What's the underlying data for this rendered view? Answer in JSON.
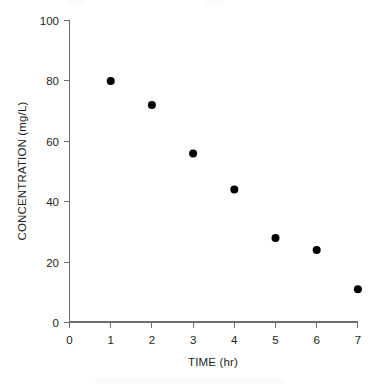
{
  "chart_data": {
    "type": "scatter",
    "title": "",
    "subtitle": "",
    "xlabel": "TIME (hr)",
    "ylabel": "CONCENTRATION (mg/L)",
    "xlim": [
      0,
      7
    ],
    "ylim": [
      0,
      100
    ],
    "xticks": [
      0,
      1,
      2,
      3,
      4,
      5,
      6,
      7
    ],
    "yticks": [
      0,
      20,
      40,
      60,
      80,
      100
    ],
    "xtick_labels": [
      "0",
      "1",
      "2",
      "3",
      "4",
      "5",
      "6",
      "7"
    ],
    "ytick_labels": [
      "0",
      "20",
      "40",
      "60",
      "80",
      "100"
    ],
    "grid": false,
    "legend": null,
    "marker": {
      "shape": "circle",
      "color": "#000000",
      "size_px": 8
    },
    "axis_color": "#6d6e71",
    "text_color": "#231f20",
    "background": "#ffffff",
    "series": [
      {
        "name": "concentration",
        "x": [
          1,
          2,
          3,
          4,
          5,
          6,
          7
        ],
        "values": [
          80,
          72,
          56,
          44,
          28,
          24,
          11
        ],
        "points": [
          {
            "x": 1,
            "y": 80
          },
          {
            "x": 2,
            "y": 72
          },
          {
            "x": 3,
            "y": 56
          },
          {
            "x": 4,
            "y": 44
          },
          {
            "x": 5,
            "y": 28
          },
          {
            "x": 6,
            "y": 24
          },
          {
            "x": 7,
            "y": 11
          }
        ]
      }
    ]
  }
}
